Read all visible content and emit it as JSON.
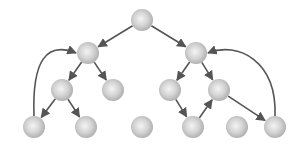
{
  "diagram": {
    "type": "directed-tree-graph",
    "width": 302,
    "height": 148,
    "node_radius": 11,
    "colors": {
      "background": "#ffffff",
      "node_light": "#f4f4f4",
      "node_mid": "#d2d2d2",
      "node_dark": "#a9a9a9",
      "edge": "#555555"
    },
    "nodes": [
      {
        "id": "root",
        "x": 142,
        "y": 20
      },
      {
        "id": "a",
        "x": 88,
        "y": 53
      },
      {
        "id": "b",
        "x": 196,
        "y": 53
      },
      {
        "id": "a1",
        "x": 62,
        "y": 90
      },
      {
        "id": "a2",
        "x": 113,
        "y": 90
      },
      {
        "id": "b1",
        "x": 170,
        "y": 90
      },
      {
        "id": "b2",
        "x": 219,
        "y": 90
      },
      {
        "id": "a1a",
        "x": 34,
        "y": 127
      },
      {
        "id": "a1b",
        "x": 86,
        "y": 127
      },
      {
        "id": "c",
        "x": 142,
        "y": 127
      },
      {
        "id": "b1a",
        "x": 193,
        "y": 127
      },
      {
        "id": "d",
        "x": 237,
        "y": 127
      },
      {
        "id": "b2a",
        "x": 275,
        "y": 127
      }
    ],
    "edges": [
      {
        "from": "root",
        "to": "a",
        "kind": "straight"
      },
      {
        "from": "root",
        "to": "b",
        "kind": "straight"
      },
      {
        "from": "a",
        "to": "a1",
        "kind": "straight"
      },
      {
        "from": "a",
        "to": "a2",
        "kind": "straight"
      },
      {
        "from": "b",
        "to": "b1",
        "kind": "straight"
      },
      {
        "from": "b",
        "to": "b2",
        "kind": "straight"
      },
      {
        "from": "a1",
        "to": "a1a",
        "kind": "straight"
      },
      {
        "from": "a1",
        "to": "a1b",
        "kind": "straight"
      },
      {
        "from": "b1",
        "to": "b1a",
        "kind": "straight"
      },
      {
        "from": "b1a",
        "to": "b2",
        "kind": "straight"
      },
      {
        "from": "b2",
        "to": "b2a",
        "kind": "straight"
      },
      {
        "from": "a1a",
        "to": "a",
        "kind": "curved",
        "bend": "left"
      },
      {
        "from": "b2a",
        "to": "b",
        "kind": "curved",
        "bend": "right"
      }
    ]
  }
}
